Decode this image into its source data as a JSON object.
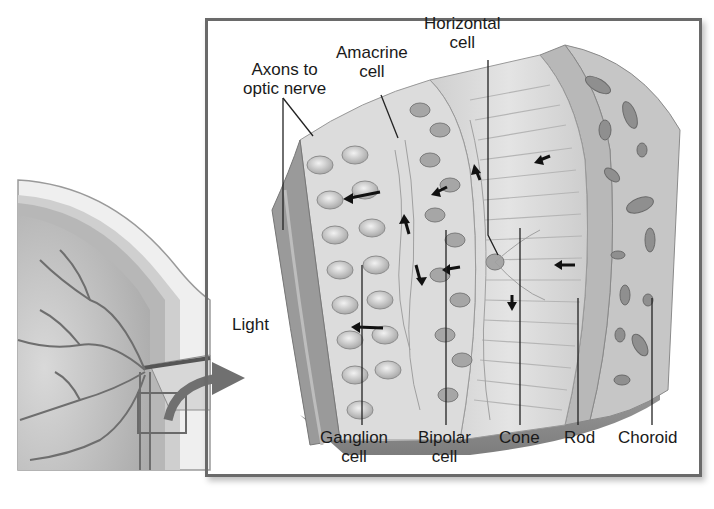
{
  "figure": {
    "inset_frame_color": "#6a6a6a",
    "arrow_color": "#7a7a7a"
  },
  "labels": {
    "axons": {
      "line1": "Axons to",
      "line2": "optic nerve"
    },
    "amacrine": {
      "line1": "Amacrine",
      "line2": "cell"
    },
    "horizontal": {
      "line1": "Horizontal",
      "line2": "cell"
    },
    "light": "Light",
    "ganglion": {
      "line1": "Ganglion",
      "line2": "cell"
    },
    "bipolar": {
      "line1": "Bipolar",
      "line2": "cell"
    },
    "cone": "Cone",
    "rod": "Rod",
    "choroid": "Choroid"
  }
}
